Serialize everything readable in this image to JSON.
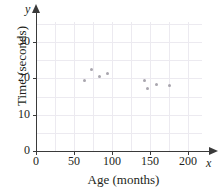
{
  "chart_data": {
    "type": "scatter",
    "title": "",
    "xlabel": "Age (months)",
    "ylabel": "Time (seconds)",
    "x_var_symbol": "x",
    "y_var_symbol": "y",
    "xlim": [
      0,
      220
    ],
    "ylim": [
      0,
      35
    ],
    "xticks": [
      0,
      50,
      100,
      150,
      200
    ],
    "xticklabels": [
      "0",
      "50",
      "100",
      "150",
      "200"
    ],
    "yticks": [
      0,
      10,
      20,
      30
    ],
    "yticklabels": [
      "0",
      "10",
      "20",
      "30"
    ],
    "grid": true,
    "grid_color": "#eceaf0",
    "legend": null,
    "point_color": "#a9a6ae",
    "axis_color": "#3a3a3a",
    "points": [
      {
        "x": 64,
        "y": 19.5
      },
      {
        "x": 73,
        "y": 22.3
      },
      {
        "x": 83,
        "y": 20.4
      },
      {
        "x": 94,
        "y": 21.2
      },
      {
        "x": 143,
        "y": 19.5
      },
      {
        "x": 147,
        "y": 17.3
      },
      {
        "x": 158,
        "y": 18.3
      },
      {
        "x": 176,
        "y": 18.0
      }
    ],
    "x": [
      64,
      73,
      83,
      94,
      143,
      147,
      158,
      176
    ],
    "y": [
      19.5,
      22.3,
      20.4,
      21.2,
      19.5,
      17.3,
      18.3,
      18.0
    ]
  }
}
